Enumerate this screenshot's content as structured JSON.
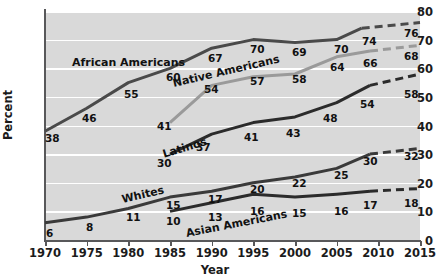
{
  "chart_data": {
    "type": "line",
    "title": "",
    "xlabel": "Year",
    "ylabel": "Percent",
    "x": [
      1970,
      1975,
      1980,
      1985,
      1990,
      1995,
      2000,
      2005,
      2010,
      2015
    ],
    "xlim": [
      1970,
      2015
    ],
    "ylim": [
      0,
      80
    ],
    "ytick_labels": [
      "0",
      "10",
      "20",
      "30",
      "40",
      "50",
      "60",
      "70",
      "80"
    ],
    "xtick_labels": [
      "1970",
      "1975",
      "1980",
      "1985",
      "1990",
      "1995",
      "2000",
      "2005",
      "2010",
      "2015"
    ],
    "grid": "horizontal",
    "legend": "inline-labels",
    "projection_note": "dashed segments are projections beginning near 2008-2009",
    "series": [
      {
        "name": "African Americans",
        "color": "#4a4a4a",
        "x": [
          1970,
          1975,
          1980,
          1985,
          1990,
          1995,
          2000,
          2005,
          2008,
          2015
        ],
        "values": [
          38,
          46,
          55,
          60,
          67,
          70,
          69,
          70,
          74,
          76
        ],
        "labels": [
          "38",
          "46",
          "55",
          "60",
          "67",
          "70",
          "69",
          "70",
          "74",
          "76"
        ],
        "dashed_from": 2008
      },
      {
        "name": "Native Americans",
        "color": "#9a9a9a",
        "x": [
          1985,
          1990,
          1995,
          2000,
          2005,
          2009,
          2015
        ],
        "values": [
          41,
          54,
          57,
          58,
          64,
          66,
          68
        ],
        "labels": [
          "41",
          "54",
          "57",
          "58",
          "64",
          "66",
          "68"
        ],
        "dashed_from": 2009
      },
      {
        "name": "Latinos",
        "color": "#2b2b2b",
        "x": [
          1985,
          1990,
          1995,
          2000,
          2005,
          2009,
          2015
        ],
        "values": [
          30,
          37,
          41,
          43,
          48,
          54,
          58
        ],
        "labels": [
          "30",
          "37",
          "41",
          "43",
          "48",
          "54",
          "58"
        ],
        "dashed_from": 2009
      },
      {
        "name": "Whites",
        "color": "#3a3a3a",
        "x": [
          1970,
          1975,
          1980,
          1985,
          1990,
          1995,
          2000,
          2005,
          2009,
          2015
        ],
        "values": [
          6,
          8,
          11,
          15,
          17,
          20,
          22,
          25,
          30,
          32
        ],
        "labels": [
          "6",
          "8",
          "11",
          "15",
          "17",
          "20",
          "22",
          "25",
          "30",
          "32"
        ],
        "dashed_from": 2009
      },
      {
        "name": "Asian Americans",
        "color": "#2b2b2b",
        "x": [
          1985,
          1990,
          1995,
          2000,
          2005,
          2009,
          2015
        ],
        "values": [
          10,
          13,
          16,
          15,
          16,
          17,
          18
        ],
        "labels": [
          "10",
          "13",
          "16",
          "15",
          "16",
          "17",
          "18"
        ],
        "dashed_from": 2009
      }
    ]
  },
  "axis": {
    "y_label": "Percent",
    "x_label": "Year",
    "y_ticks": [
      "80",
      "70",
      "60",
      "50",
      "40",
      "30",
      "20",
      "10",
      "0"
    ],
    "x_ticks": [
      "1970",
      "1975",
      "1980",
      "1985",
      "1990",
      "1995",
      "2000",
      "2005",
      "2010",
      "2015"
    ]
  },
  "series_names": {
    "african_americans": "African Americans",
    "native_americans": "Native Americans",
    "latinos": "Latinos",
    "whites": "Whites",
    "asian_americans": "Asian Americans"
  },
  "values": {
    "aa": [
      "38",
      "46",
      "55",
      "60",
      "67",
      "70",
      "69",
      "70",
      "74",
      "76"
    ],
    "na": [
      "41",
      "54",
      "57",
      "58",
      "64",
      "66",
      "68"
    ],
    "lat": [
      "30",
      "37",
      "41",
      "43",
      "48",
      "54",
      "58"
    ],
    "wh": [
      "6",
      "8",
      "11",
      "15",
      "17",
      "20",
      "22",
      "25",
      "30",
      "32"
    ],
    "as": [
      "10",
      "13",
      "16",
      "15",
      "16",
      "17",
      "18"
    ]
  },
  "colors": {
    "plot_background": "#d9d9d9",
    "gridline": "#ffffff",
    "axis": "#58585a",
    "dark_line": "#3a3a3a",
    "light_line": "#9a9a9a",
    "page_background": "#ffffff"
  }
}
